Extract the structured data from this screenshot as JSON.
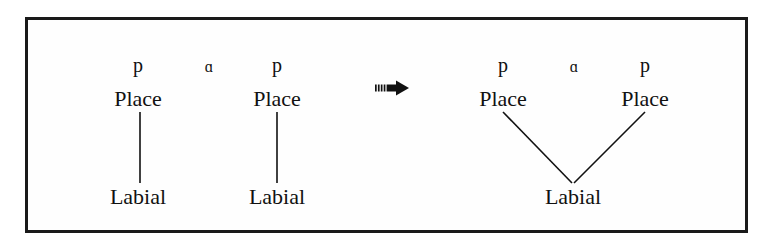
{
  "figure": {
    "border_color": "#1a1a1a",
    "background_color": "#ffffff",
    "text_color": "#111111"
  },
  "left_structure": {
    "name": "input-representation",
    "segments": [
      {
        "id": "seg-p1",
        "text": "p",
        "type": "consonant"
      },
      {
        "id": "seg-a",
        "text": "ɑ",
        "type": "vowel"
      },
      {
        "id": "seg-p2",
        "text": "p",
        "type": "consonant"
      }
    ],
    "place_nodes": [
      {
        "id": "place-left-1",
        "text": "Place"
      },
      {
        "id": "place-left-2",
        "text": "Place"
      }
    ],
    "terminal_nodes": [
      {
        "id": "labial-left-1",
        "text": "Labial"
      },
      {
        "id": "labial-left-2",
        "text": "Labial"
      }
    ]
  },
  "operator": {
    "name": "rightwards-arrow",
    "glyph": "⇒",
    "meaning": "becomes"
  },
  "right_structure": {
    "name": "output-representation",
    "segments": [
      {
        "id": "seg-p3",
        "text": "p",
        "type": "consonant"
      },
      {
        "id": "seg-a2",
        "text": "ɑ",
        "type": "vowel"
      },
      {
        "id": "seg-p4",
        "text": "p",
        "type": "consonant"
      }
    ],
    "place_nodes": [
      {
        "id": "place-right-1",
        "text": "Place"
      },
      {
        "id": "place-right-2",
        "text": "Place"
      }
    ],
    "terminal_nodes": [
      {
        "id": "labial-right-shared",
        "text": "Labial"
      }
    ]
  }
}
